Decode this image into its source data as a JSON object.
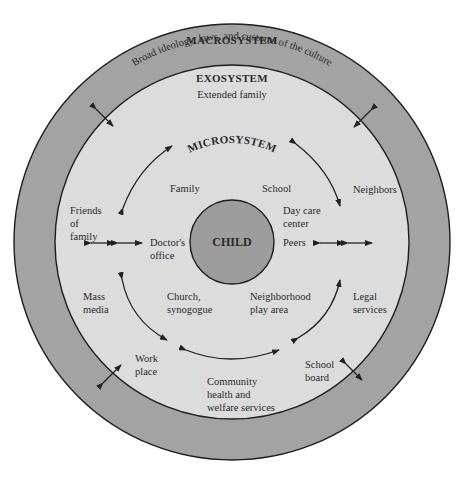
{
  "colors": {
    "macro_ring": "#a3a3a3",
    "exo_fill": "#dcdcdc",
    "child_fill": "#9d9d9d",
    "outline": "#1e1e1e",
    "background": "#ffffff"
  },
  "macrosystem": {
    "title": "MACROSYSTEM",
    "subtitle": "Broad ideology, laws, and customs of the culture"
  },
  "exosystem": {
    "title": "EXOSYSTEM",
    "items": {
      "extended_family": "Extended family",
      "friends_of_family": [
        "Friends",
        "of",
        "family"
      ],
      "neighbors": "Neighbors",
      "mass_media": [
        "Mass",
        "media"
      ],
      "legal_services": [
        "Legal",
        "services"
      ],
      "work_place": [
        "Work",
        "place"
      ],
      "school_board": [
        "School",
        "board"
      ],
      "community_services": [
        "Community",
        "health and",
        "welfare services"
      ]
    }
  },
  "microsystem": {
    "title": "MICROSYSTEM",
    "items": {
      "family": "Family",
      "school": "School",
      "day_care": [
        "Day care",
        "center"
      ],
      "peers": "Peers",
      "doctors_office": [
        "Doctor's",
        "office"
      ],
      "church": [
        "Church,",
        "synogogue"
      ],
      "neighborhood": [
        "Neighborhood",
        "play area"
      ]
    }
  },
  "center": {
    "label": "CHILD"
  }
}
